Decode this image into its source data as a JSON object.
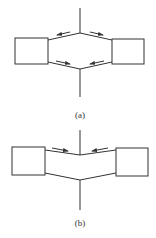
{
  "figure": {
    "panels": [
      {
        "id": "a",
        "caption": "(a)",
        "description": "Two boxes joined by a hexagonal (diverging) connection with opposing arrows along upper and lower members"
      },
      {
        "id": "b",
        "caption": "(b)",
        "description": "Two boxes joined by a V-shaped (converging) connection with arrows along upper members pointing to center"
      }
    ],
    "colors": {
      "stroke": "#333333",
      "background": "#ffffff"
    }
  }
}
